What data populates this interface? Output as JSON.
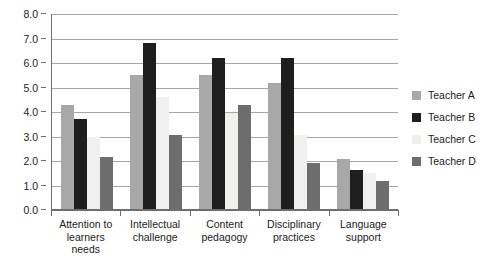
{
  "chart_data": {
    "type": "bar",
    "title": "",
    "subtitle": "",
    "xlabel": "",
    "ylabel": "",
    "ylim": [
      0.0,
      8.0
    ],
    "ytick_step": 1.0,
    "ytick_labels": [
      "0.0",
      "1.0",
      "2.0",
      "3.0",
      "4.0",
      "5.0",
      "6.0",
      "7.0",
      "8.0"
    ],
    "ytick_values": [
      0.0,
      1.0,
      2.0,
      3.0,
      4.0,
      5.0,
      6.0,
      7.0,
      8.0
    ],
    "grid": true,
    "grid_axis": "y",
    "legend_position": "right",
    "categories": [
      "Attention to\nlearners\nneeds",
      "Intellectual\nchallenge",
      "Content\npedagogy",
      "Disciplinary\npractices",
      "Language\nsupport"
    ],
    "series": [
      {
        "name": "Teacher A",
        "color": "#a8a8a8",
        "values": [
          4.3,
          5.5,
          5.5,
          5.2,
          2.1
        ]
      },
      {
        "name": "Teacher B",
        "color": "#1e1e1e",
        "values": [
          3.7,
          6.8,
          6.2,
          6.2,
          1.65
        ]
      },
      {
        "name": "Teacher C",
        "color": "#f0f0ee",
        "values": [
          3.0,
          4.6,
          3.95,
          3.05,
          1.5
        ]
      },
      {
        "name": "Teacher D",
        "color": "#6d6d6d",
        "values": [
          2.15,
          3.05,
          4.3,
          1.9,
          1.2
        ]
      }
    ]
  },
  "legend": {
    "entries": [
      {
        "label": "Teacher A"
      },
      {
        "label": "Teacher B"
      },
      {
        "label": "Teacher C"
      },
      {
        "label": "Teacher D"
      }
    ]
  },
  "colors": {
    "series_a": "#a8a8a8",
    "series_b": "#1e1e1e",
    "series_c": "#f0f0ee",
    "series_d": "#6d6d6d",
    "gridline": "#a6a6a6",
    "axis": "#6e6e6e",
    "text": "#1b1b1b",
    "background": "#ffffff"
  }
}
